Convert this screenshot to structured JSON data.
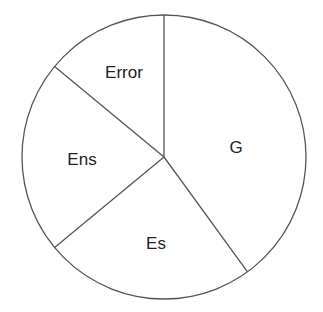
{
  "chart_data": {
    "type": "pie",
    "title": "",
    "start_angle_deg": 0,
    "direction": "clockwise",
    "categories": [
      "G",
      "Es",
      "Ens",
      "Error"
    ],
    "values": [
      40,
      24,
      22,
      14
    ],
    "unit": "percent (estimated from slice angles)",
    "labels_inside": true,
    "legend": "none",
    "colors": {
      "fill": "#ffffff",
      "stroke": "#555555",
      "text": "#222222"
    }
  },
  "labels": {
    "g": "G",
    "es": "Es",
    "ens": "Ens",
    "error": "Error"
  }
}
